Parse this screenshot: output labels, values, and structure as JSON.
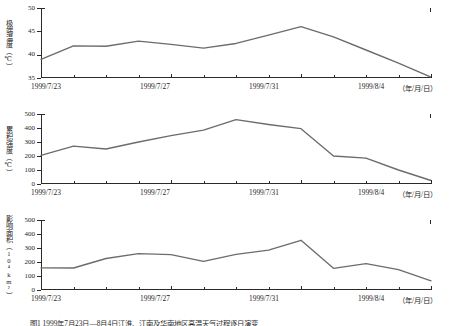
{
  "figure": {
    "caption": "图1  1999年7月23日—8月4日江淮、江南及华南地区高温天气过程逐日演变",
    "line_color": "#6e6c6a",
    "axis_color": "#2a2a2a",
    "background": "#ffffff"
  },
  "x_axis": {
    "tick_labels": [
      "1999/7/23",
      "1999/7/27",
      "1999/7/31",
      "1999/8/4"
    ],
    "unit_label": "（年/月/日）",
    "dates": [
      "1999/7/23",
      "1999/7/24",
      "1999/7/25",
      "1999/7/26",
      "1999/7/27",
      "1999/7/28",
      "1999/7/29",
      "1999/7/30",
      "1999/7/31",
      "1999/8/1",
      "1999/8/2",
      "1999/8/3",
      "1999/8/4"
    ],
    "n_points": 13
  },
  "panels": [
    {
      "id": "panel-extreme-temperature",
      "ylabel_text": "极端温度",
      "ylabel_unit": "（℃）",
      "y_ticks": [
        "35",
        "40",
        "45",
        "50"
      ]
    },
    {
      "id": "panel-cumulative-intensity",
      "ylabel_text": "累积强度",
      "ylabel_unit": "（℃）",
      "y_ticks": [
        "0",
        "100",
        "200",
        "300",
        "400",
        "500"
      ]
    },
    {
      "id": "panel-affected-area",
      "ylabel_text": "影响面积",
      "ylabel_unit": "（10⁴km²）",
      "y_ticks": [
        "0",
        "100",
        "200",
        "300",
        "400",
        "500"
      ]
    }
  ],
  "chart_data": [
    {
      "type": "line",
      "title": "极端温度（℃）",
      "xlabel": "（年/月/日）",
      "ylabel": "极端温度（℃）",
      "x": [
        "1999/7/23",
        "1999/7/24",
        "1999/7/25",
        "1999/7/26",
        "1999/7/27",
        "1999/7/28",
        "1999/7/29",
        "1999/7/30",
        "1999/7/31",
        "1999/8/1",
        "1999/8/2",
        "1999/8/3",
        "1999/8/4"
      ],
      "values": [
        39.0,
        41.9,
        41.8,
        42.9,
        42.2,
        41.4,
        42.4,
        44.2,
        46.0,
        44.3,
        42.0,
        39.0,
        36.6,
        35.2
      ],
      "series_values": [
        39.0,
        41.9,
        41.8,
        42.9,
        42.2,
        41.4,
        42.4,
        44.2,
        46.0,
        43.8,
        41.0,
        38.2,
        35.2
      ],
      "ylim": [
        35,
        50
      ],
      "yticks": [
        35,
        40,
        45,
        50
      ],
      "grid": false,
      "legend": false,
      "line_color": "#6e6c6a"
    },
    {
      "type": "line",
      "title": "累积强度（℃）",
      "xlabel": "（年/月/日）",
      "ylabel": "累积强度（℃）",
      "x": [
        "1999/7/23",
        "1999/7/24",
        "1999/7/25",
        "1999/7/26",
        "1999/7/27",
        "1999/7/28",
        "1999/7/29",
        "1999/7/30",
        "1999/7/31",
        "1999/8/1",
        "1999/8/2",
        "1999/8/3",
        "1999/8/4"
      ],
      "series_values": [
        205,
        270,
        250,
        300,
        345,
        385,
        460,
        425,
        395,
        300,
        200,
        185,
        100,
        25
      ],
      "values": [
        205,
        270,
        250,
        300,
        345,
        385,
        460,
        425,
        395,
        200,
        185,
        100,
        25
      ],
      "ylim": [
        0,
        500
      ],
      "yticks": [
        0,
        100,
        200,
        300,
        400,
        500
      ],
      "grid": false,
      "legend": false,
      "line_color": "#6e6c6a"
    },
    {
      "type": "line",
      "title": "影响面积（10⁴km²）",
      "xlabel": "（年/月/日）",
      "ylabel": "影响面积（10⁴km²）",
      "x": [
        "1999/7/23",
        "1999/7/24",
        "1999/7/25",
        "1999/7/26",
        "1999/7/27",
        "1999/7/28",
        "1999/7/29",
        "1999/7/30",
        "1999/7/31",
        "1999/8/1",
        "1999/8/2",
        "1999/8/3",
        "1999/8/4"
      ],
      "series_values": [
        158,
        157,
        225,
        260,
        253,
        205,
        255,
        285,
        355,
        255,
        155,
        188,
        145,
        65
      ],
      "values": [
        158,
        157,
        225,
        260,
        253,
        205,
        255,
        285,
        355,
        155,
        188,
        145,
        65
      ],
      "ylim": [
        0,
        500
      ],
      "yticks": [
        0,
        100,
        200,
        300,
        400,
        500
      ],
      "grid": false,
      "legend": false,
      "line_color": "#6e6c6a"
    }
  ]
}
